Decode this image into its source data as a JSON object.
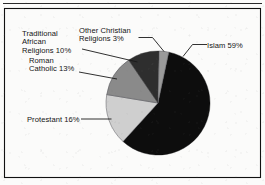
{
  "chart_data": {
    "type": "pie",
    "title": "",
    "xlabel": "",
    "ylabel": "",
    "units": "percent",
    "legend_position": "callout-labels",
    "grid": false,
    "start_angle_deg": 12,
    "direction": "clockwise",
    "categories": [
      "Islam",
      "Protestant",
      "Roman Catholic",
      "Traditional African Religions",
      "Other Christian Religions"
    ],
    "values": [
      59,
      16,
      13,
      10,
      3
    ],
    "labels": [
      "Islam 59%",
      "Protestant 16%",
      "Roman Catholic 13%",
      "Traditional African Religions 10%",
      "Other Christian Religions 3%"
    ],
    "colors": [
      "#0d0d0d",
      "#cfcfcf",
      "#8a8a8a",
      "#2e2e2e",
      "#9a9a9a"
    ],
    "slices": [
      {
        "name": "Islam",
        "value": 59,
        "label": "Islam 59%",
        "color": "#0d0d0d"
      },
      {
        "name": "Protestant",
        "value": 16,
        "label": "Protestant 16%",
        "color": "#cfcfcf"
      },
      {
        "name": "Roman Catholic",
        "value": 13,
        "label": "Roman Catholic 13%",
        "color": "#8a8a8a"
      },
      {
        "name": "Traditional African Religions",
        "value": 10,
        "label": "Traditional African Religions 10%",
        "color": "#2e2e2e"
      },
      {
        "name": "Other Christian Religions",
        "value": 3,
        "label": "Other Christian Religions 3%",
        "color": "#9a9a9a"
      }
    ]
  },
  "callouts": {
    "islam": {
      "line1": "Islam 59%"
    },
    "protestant": {
      "line1": "Protestant 16%"
    },
    "roman_catholic": {
      "line1": "Roman",
      "line2": "Catholic 13%"
    },
    "traditional_african": {
      "line1": "Traditional",
      "line2": "African",
      "line3": "Religions 10%"
    },
    "other_christian": {
      "line1": "Other Christian",
      "line2": "Religions 3%"
    }
  },
  "style": {
    "background": "#fbfbfa",
    "border_color": "#111111",
    "text_color": "#141414"
  }
}
